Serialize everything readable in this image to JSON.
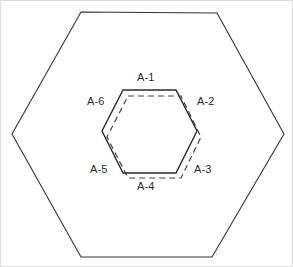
{
  "figure": {
    "background_color": "#ffffff",
    "stroke_color": "#333333",
    "label_color": "#2b2b2b",
    "outer_hexagon": {
      "name": "outer-hexagon",
      "line_style": "solid",
      "stroke_width": 1.1,
      "vertices": [
        [
          80,
          11
        ],
        [
          216,
          12
        ],
        [
          283,
          133
        ],
        [
          211,
          256
        ],
        [
          80,
          256
        ],
        [
          11,
          133
        ]
      ]
    },
    "inner_hexagon_solid": {
      "name": "inner-hexagon-solid",
      "line_style": "solid",
      "stroke_width": 1.4,
      "vertices": [
        [
          122,
          89
        ],
        [
          175,
          89
        ],
        [
          196,
          130
        ],
        [
          175,
          172
        ],
        [
          122,
          172
        ],
        [
          101,
          130
        ]
      ]
    },
    "inner_hexagon_dashed": {
      "name": "inner-hexagon-dashed",
      "line_style": "dashed",
      "stroke_width": 1.2,
      "dash_pattern": "6,4",
      "vertices": [
        [
          127,
          95
        ],
        [
          180,
          95
        ],
        [
          200,
          136
        ],
        [
          180,
          177
        ],
        [
          127,
          177
        ],
        [
          106,
          136
        ]
      ]
    },
    "labels": [
      {
        "id": "A-1",
        "text": "A-1",
        "position": "top",
        "x": 136,
        "y": 71
      },
      {
        "id": "A-2",
        "text": "A-2",
        "position": "upper-right",
        "x": 196,
        "y": 95
      },
      {
        "id": "A-3",
        "text": "A-3",
        "position": "lower-right",
        "x": 193,
        "y": 163
      },
      {
        "id": "A-4",
        "text": "A-4",
        "position": "bottom",
        "x": 136,
        "y": 180
      },
      {
        "id": "A-5",
        "text": "A-5",
        "position": "lower-left",
        "x": 89,
        "y": 163
      },
      {
        "id": "A-6",
        "text": "A-6",
        "position": "upper-left",
        "x": 86,
        "y": 95
      }
    ]
  }
}
